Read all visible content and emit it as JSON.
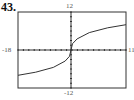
{
  "problem_number": "43.",
  "chart_data": {
    "type": "line",
    "title": "",
    "xlabel": "",
    "ylabel": "",
    "window": {
      "xmin": -18,
      "xmax": 11,
      "ymin": -12,
      "ymax": 12
    },
    "tick_labels": {
      "top": "12",
      "bottom": "-12",
      "left": "-18",
      "right": "11"
    },
    "grid": false,
    "series": [
      {
        "name": "curve",
        "x": [
          -18,
          -12,
          -6,
          -2,
          -0.5,
          0,
          0.5,
          2,
          6,
          12,
          18
        ],
        "y": [
          -8,
          -7,
          -5.5,
          -3.5,
          -2,
          0,
          2,
          3.5,
          5.5,
          7,
          8
        ]
      }
    ]
  }
}
